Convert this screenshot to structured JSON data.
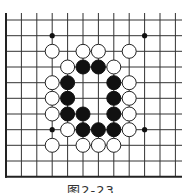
{
  "figure": {
    "caption": "图2-23",
    "type": "go-board-diagram"
  },
  "board": {
    "columns_x": [
      6,
      21.4,
      36.8,
      52.2,
      67.6,
      83,
      98.4,
      113.8,
      129.2,
      144.6,
      160,
      175.4
    ],
    "rows_y": [
      20,
      35.7,
      51.3,
      67,
      82.7,
      98.3,
      114,
      129.7,
      145.3,
      161,
      176.7
    ],
    "line_top_y": 13,
    "line_right_x": 182,
    "left_border_x": 6,
    "bottom_border_y": 176.7,
    "stone_radius": 7,
    "colors": {
      "line": "#333333",
      "border": "#222222",
      "black_stone": "#111111",
      "white_stone_fill": "#ffffff",
      "white_stone_stroke": "#222222"
    },
    "star_points": [
      {
        "col": 3,
        "row": 1
      },
      {
        "col": 9,
        "row": 1
      },
      {
        "col": 3,
        "row": 7
      },
      {
        "col": 9,
        "row": 7
      }
    ],
    "stones": [
      {
        "color": "white",
        "col": 3,
        "row": 2
      },
      {
        "color": "white",
        "col": 5,
        "row": 2
      },
      {
        "color": "white",
        "col": 6,
        "row": 2
      },
      {
        "color": "white",
        "col": 8,
        "row": 2
      },
      {
        "color": "white",
        "col": 4,
        "row": 3
      },
      {
        "color": "black",
        "col": 5,
        "row": 3
      },
      {
        "color": "black",
        "col": 6,
        "row": 3
      },
      {
        "color": "white",
        "col": 7,
        "row": 3
      },
      {
        "color": "white",
        "col": 3,
        "row": 4
      },
      {
        "color": "black",
        "col": 4,
        "row": 4
      },
      {
        "color": "black",
        "col": 7,
        "row": 4
      },
      {
        "color": "white",
        "col": 8,
        "row": 4
      },
      {
        "color": "white",
        "col": 3,
        "row": 5
      },
      {
        "color": "black",
        "col": 4,
        "row": 5
      },
      {
        "color": "black",
        "col": 7,
        "row": 5
      },
      {
        "color": "white",
        "col": 8,
        "row": 5
      },
      {
        "color": "white",
        "col": 3,
        "row": 6
      },
      {
        "color": "black",
        "col": 4,
        "row": 6
      },
      {
        "color": "black",
        "col": 5,
        "row": 6
      },
      {
        "color": "black",
        "col": 7,
        "row": 6
      },
      {
        "color": "white",
        "col": 8,
        "row": 6
      },
      {
        "color": "white",
        "col": 4,
        "row": 7
      },
      {
        "color": "black",
        "col": 5,
        "row": 7
      },
      {
        "color": "black",
        "col": 6,
        "row": 7
      },
      {
        "color": "black",
        "col": 7,
        "row": 7
      },
      {
        "color": "white",
        "col": 8,
        "row": 7
      },
      {
        "color": "white",
        "col": 3,
        "row": 8
      },
      {
        "color": "white",
        "col": 5,
        "row": 8
      },
      {
        "color": "white",
        "col": 6,
        "row": 8
      },
      {
        "color": "white",
        "col": 7,
        "row": 8
      }
    ]
  }
}
